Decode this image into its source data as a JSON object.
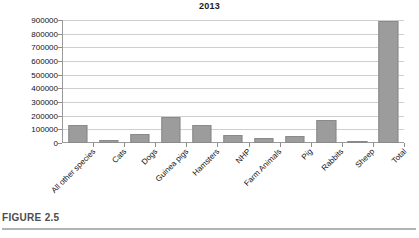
{
  "figure": {
    "caption": "FIGURE 2.5"
  },
  "chart_data": {
    "type": "bar",
    "title": "2013",
    "xlabel": "",
    "ylabel": "",
    "ylim": [
      0,
      900000
    ],
    "ytick_step": 100000,
    "grid": true,
    "legend": "none",
    "bar_color": "#9c9c9c",
    "yticks": [
      "900000",
      "800000",
      "700000",
      "600000",
      "500000",
      "400000",
      "300000",
      "200000",
      "100000",
      "0"
    ],
    "categories": [
      "All other species",
      "Cats",
      "Dogs",
      "Guinea pigs",
      "Hamsters",
      "NHP",
      "Farm Animals",
      "Pig",
      "Rabbits",
      "Sheep",
      "Total"
    ],
    "values": [
      132000,
      25000,
      65000,
      192000,
      134000,
      62000,
      36000,
      52000,
      168000,
      15000,
      895000
    ]
  }
}
